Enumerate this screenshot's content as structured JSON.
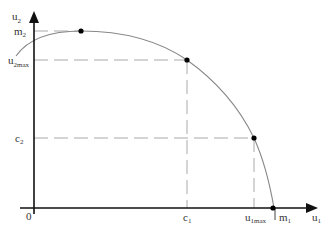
{
  "axes": {
    "x_label": "u",
    "x_label_sub": "1",
    "y_label": "u",
    "y_label_sub": "2",
    "origin_label": "0"
  },
  "y_ticks": [
    {
      "main": "m",
      "sub": "2"
    },
    {
      "main": "u",
      "sub": "2max"
    },
    {
      "main": "c",
      "sub": "2"
    }
  ],
  "x_ticks": [
    {
      "main": "c",
      "sub": "1"
    },
    {
      "main": "u",
      "sub": "1max"
    },
    {
      "main": "m",
      "sub": "1"
    }
  ],
  "colors": {
    "axis": "#111111",
    "curve": "#888888",
    "dashed": "#aaaaaa",
    "point": "#000000"
  },
  "points": [
    {
      "name": "m2-peak"
    },
    {
      "name": "c1-u2max"
    },
    {
      "name": "u1max-c2"
    },
    {
      "name": "m1-intercept"
    }
  ]
}
